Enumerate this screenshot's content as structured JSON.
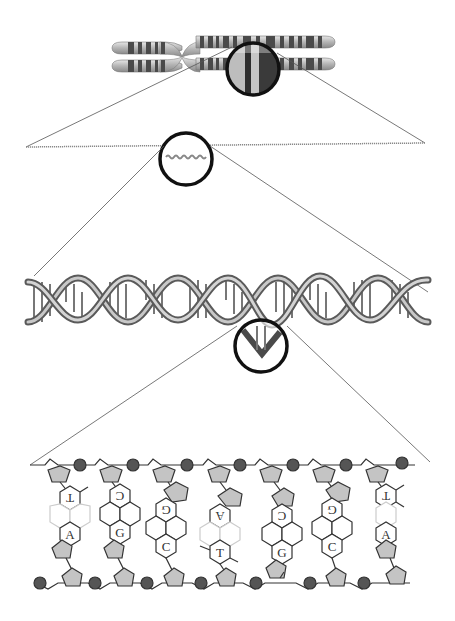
{
  "diagram": {
    "levels": [
      {
        "name": "chromosome",
        "label": ""
      },
      {
        "name": "chromatin-fiber",
        "label": ""
      },
      {
        "name": "double-helix",
        "label": ""
      },
      {
        "name": "base-pairs",
        "label": ""
      }
    ],
    "colors": {
      "background": "#ffffff",
      "outline": "#222222",
      "zoom_circle": "#111111",
      "chromosome_band_dark": "#4a4a4a",
      "chromosome_band_light": "#c8c8c8",
      "sugar_fill": "#c4c4c4",
      "phosphate_fill": "#555555",
      "helix_ribbon": "#9a9a9a"
    },
    "base_pairs": [
      {
        "top": "T",
        "bottom": "A"
      },
      {
        "top": "C",
        "bottom": "G"
      },
      {
        "top": "G",
        "bottom": "C"
      },
      {
        "top": "A",
        "bottom": "T"
      },
      {
        "top": "C",
        "bottom": "G"
      },
      {
        "top": "G",
        "bottom": "C"
      },
      {
        "top": "T",
        "bottom": "A"
      }
    ]
  }
}
